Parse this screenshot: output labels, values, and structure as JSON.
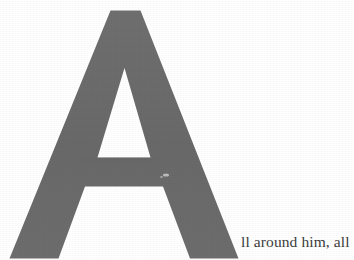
{
  "page": {
    "kind": "scanned-book-page",
    "background_color": "#ffffff",
    "width": 354,
    "height": 260
  },
  "dropcap": {
    "letter": "A",
    "fill_color": "#6b6b6b",
    "style": "sans-serif-heavy",
    "region": {
      "left": 0,
      "top": 10,
      "right": 238,
      "bottom": 258
    }
  },
  "paragraph": {
    "continuation_text": "ll around him, all",
    "full_opening_words": "All around him, all",
    "text_color": "#3c3c3c"
  }
}
